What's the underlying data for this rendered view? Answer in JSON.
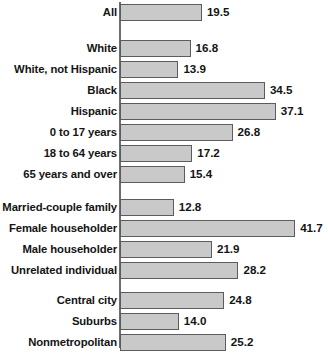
{
  "chart_data": {
    "type": "bar",
    "orientation": "horizontal",
    "title": "",
    "subtitle": "",
    "xlabel": "",
    "ylabel": "",
    "xlim": [
      0,
      45
    ],
    "grid": false,
    "legend": null,
    "value_labels": true,
    "bar_color": "#c9c9c9",
    "bar_border_color": "#5c5c5c",
    "axis_color": "#6d6d6d",
    "text_color": "#141414",
    "categories": [
      "All",
      "White",
      "White, not Hispanic",
      "Black",
      "Hispanic",
      "0 to 17 years",
      "18 to 64 years",
      "65 years and over",
      "Married-couple family",
      "Female householder",
      "Male householder",
      "Unrelated individual",
      "Central city",
      "Suburbs",
      "Nonmetropolitan"
    ],
    "values": [
      19.5,
      16.8,
      13.9,
      34.5,
      37.1,
      26.8,
      17.2,
      15.4,
      12.8,
      41.7,
      21.9,
      28.2,
      24.8,
      14.0,
      25.2
    ],
    "groups": [
      {
        "name": "total",
        "bars": [
          {
            "label": "All",
            "value": 19.5,
            "display": "19.5"
          }
        ]
      },
      {
        "name": "race-and-ethnicity",
        "bars": [
          {
            "label": "White",
            "value": 16.8,
            "display": "16.8"
          },
          {
            "label": "White, not Hispanic",
            "value": 13.9,
            "display": "13.9"
          },
          {
            "label": "Black",
            "value": 34.5,
            "display": "34.5"
          },
          {
            "label": "Hispanic",
            "value": 37.1,
            "display": "37.1"
          }
        ]
      },
      {
        "name": "age",
        "bars": [
          {
            "label": "0 to 17 years",
            "value": 26.8,
            "display": "26.8"
          },
          {
            "label": "18 to 64 years",
            "value": 17.2,
            "display": "17.2"
          },
          {
            "label": "65 years and over",
            "value": 15.4,
            "display": "15.4"
          }
        ]
      },
      {
        "name": "household-type",
        "bars": [
          {
            "label": "Married-couple family",
            "value": 12.8,
            "display": "12.8"
          },
          {
            "label": "Female householder",
            "value": 41.7,
            "display": "41.7"
          },
          {
            "label": "Male householder",
            "value": 21.9,
            "display": "21.9"
          },
          {
            "label": "Unrelated individual",
            "value": 28.2,
            "display": "28.2"
          }
        ]
      },
      {
        "name": "residence",
        "bars": [
          {
            "label": "Central city",
            "value": 24.8,
            "display": "24.8"
          },
          {
            "label": "Suburbs",
            "value": 14.0,
            "display": "14.0"
          },
          {
            "label": "Nonmetropolitan",
            "value": 25.2,
            "display": "25.2"
          }
        ]
      }
    ]
  },
  "layout": {
    "axis_x": 120,
    "px_per_unit": 4.2,
    "row_height": 21,
    "group_gap": 15,
    "group_tops": [
      2,
      38,
      122,
      197,
      290
    ]
  }
}
